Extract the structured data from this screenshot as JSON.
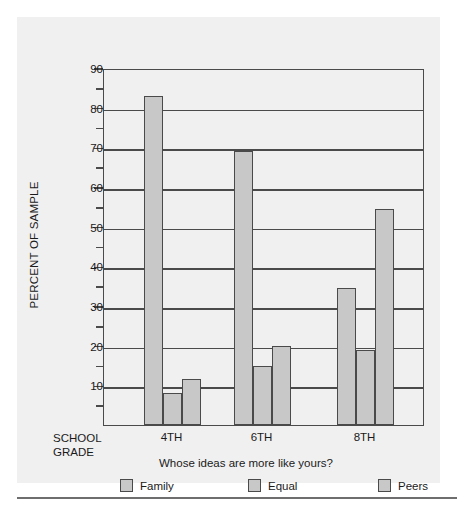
{
  "chart_data": {
    "type": "bar",
    "title": "",
    "subtitle": "Whose ideas are more like yours?",
    "xlabel": "SCHOOL GRADE",
    "ylabel": "PERCENT OF SAMPLE",
    "categories": [
      "4TH",
      "6TH",
      "8TH"
    ],
    "series": [
      {
        "name": "Family",
        "values": [
          83,
          69,
          34.5
        ]
      },
      {
        "name": "Equal",
        "values": [
          8,
          15,
          19
        ]
      },
      {
        "name": "Peers",
        "values": [
          11.5,
          20,
          54.5
        ]
      }
    ],
    "ylim": [
      0,
      90
    ],
    "ytick_major": [
      10,
      20,
      30,
      40,
      50,
      60,
      70,
      80,
      90
    ],
    "ytick_minor": [
      5,
      15,
      25,
      35,
      45,
      55,
      65,
      75,
      85
    ],
    "ytick_labels": [
      "10",
      "20",
      "30",
      "40",
      "50",
      "60",
      "70",
      "80",
      "90"
    ],
    "grid": true,
    "legend_position": "bottom",
    "bar_color": "#c8c8c8",
    "line_color": "#4a4a4a",
    "panel_color": "#f0f0f0"
  },
  "axis": {
    "y_title": "PERCENT OF SAMPLE",
    "x_title_line1": "SCHOOL",
    "x_title_line2": "GRADE"
  },
  "legend": {
    "question": "Whose ideas are more like yours?",
    "items": [
      {
        "label": "Family"
      },
      {
        "label": "Equal"
      },
      {
        "label": "Peers"
      }
    ]
  }
}
